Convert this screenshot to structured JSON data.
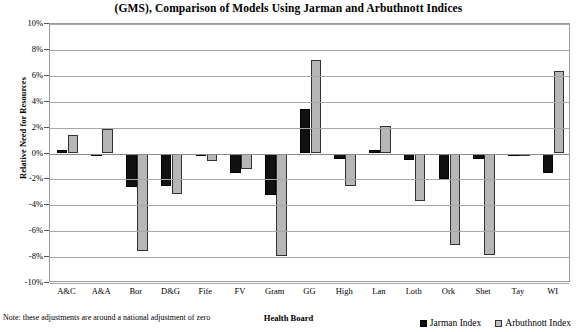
{
  "chart_data": {
    "type": "bar",
    "title": "(GMS), Comparison of Models Using Jarman and Arbuthnott Indices",
    "xlabel": "Health Board",
    "ylabel": "Relative Need for Resources",
    "note": "Note: these adjustments are around a national adjustment of zero",
    "categories": [
      "A&C",
      "A&A",
      "Bor",
      "D&G",
      "Fife",
      "FV",
      "Gram",
      "GG",
      "High",
      "Lan",
      "Loth",
      "Ork",
      "Shet",
      "Tay",
      "WI"
    ],
    "series": [
      {
        "name": "Jarman Index",
        "color": "#111111",
        "values": [
          0.3,
          -0.2,
          -2.6,
          -2.5,
          -0.2,
          -1.5,
          -3.2,
          3.4,
          -0.4,
          0.3,
          -0.5,
          -2.0,
          -0.4,
          -0.15,
          -1.5
        ]
      },
      {
        "name": "Arbuthnott Index",
        "color": "#b6b6b6",
        "values": [
          1.4,
          1.9,
          -7.5,
          -3.1,
          -0.6,
          -1.2,
          -7.9,
          7.2,
          -2.5,
          2.1,
          -3.7,
          -7.1,
          -7.8,
          -0.15,
          6.4
        ]
      }
    ],
    "ylim": [
      -10,
      10
    ],
    "ystep": 2,
    "yticks": [
      "10%",
      "8%",
      "6%",
      "4%",
      "2%",
      "0%",
      "-2%",
      "-4%",
      "-6%",
      "-8%",
      "-10%"
    ],
    "grid": true,
    "legend_position": "bottom-right-inside"
  }
}
